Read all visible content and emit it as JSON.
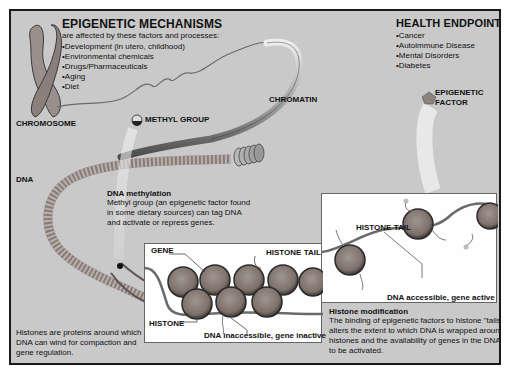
{
  "mechanisms": {
    "title": "EPIGENETIC MECHANISMS",
    "subtitle": "are affected by these factors and processes:",
    "items": [
      "Development (in utero, childhood)",
      "Environmental chemicals",
      "Drugs/Pharmaceuticals",
      "Aging",
      "Diet"
    ]
  },
  "health": {
    "title": "HEALTH ENDPOINTS",
    "items": [
      "Cancer",
      "Autoimmune Disease",
      "Mental Disorders",
      "Diabetes"
    ]
  },
  "labels": {
    "chromosome": "CHROMOSOME",
    "methyl_group": "METHYL GROUP",
    "chromatin": "CHROMATIN",
    "epigenetic_factor_1": "EPIGENETIC",
    "epigenetic_factor_2": "FACTOR",
    "dna": "DNA",
    "gene": "GENE",
    "histone_tail_left": "HISTONE TAIL",
    "histone_tail_right": "HISTONE TAIL",
    "histone": "HISTONE",
    "dna_inaccessible": "DNA inaccessible, gene inactive",
    "dna_accessible": "DNA accessible, gene active"
  },
  "methylation": {
    "title": "DNA methylation",
    "lines": [
      "Methyl group (an epigenetic factor found",
      "in some dietary sources) can tag DNA",
      "and activate or repress genes."
    ]
  },
  "histones_note": {
    "lines": [
      "Histones are proteins around which",
      "DNA can wind for compaction and",
      "gene regulation."
    ]
  },
  "histone_mod": {
    "title": "Histone modification",
    "lines": [
      "The binding of epigenetic factors to histone \"tails\"",
      "alters the extent to which DNA is wrapped around",
      "histones and the availability of genes in the DNA",
      "to be activated."
    ]
  },
  "colors": {
    "background": "#c9c9c9",
    "border": "#1a1a1a",
    "histone": "#8c7f7a",
    "panel": "#fefefe"
  }
}
